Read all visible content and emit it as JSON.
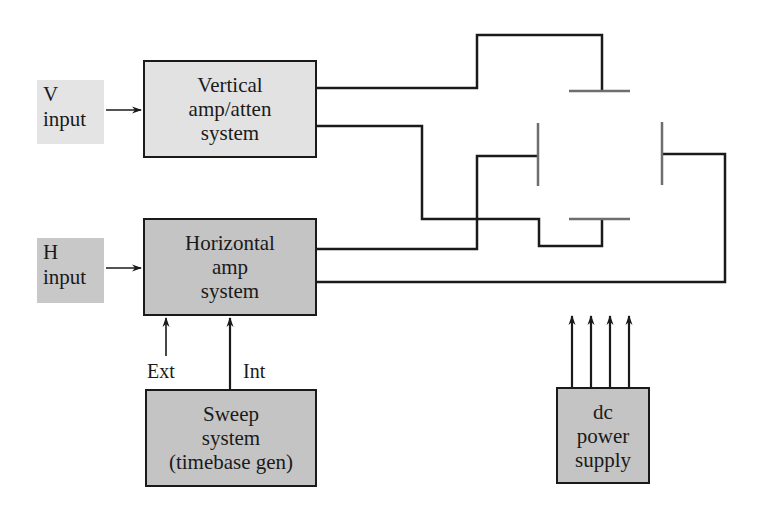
{
  "diagram": {
    "inputs": [
      {
        "id": "v-input",
        "lines": [
          "V",
          "input"
        ]
      },
      {
        "id": "h-input",
        "lines": [
          "H",
          "input"
        ]
      }
    ],
    "blocks": [
      {
        "id": "vertical",
        "lines": [
          "Vertical",
          "amp/atten",
          "system"
        ]
      },
      {
        "id": "horizontal",
        "lines": [
          "Horizontal",
          "amp",
          "system"
        ]
      },
      {
        "id": "sweep",
        "lines": [
          "Sweep",
          "system",
          "(timebase gen)"
        ]
      },
      {
        "id": "power",
        "lines": [
          "dc",
          "power",
          "supply"
        ]
      }
    ],
    "edge_labels": {
      "ext": "Ext",
      "int": "Int"
    },
    "deflection_plates": [
      "top-vertical-plate",
      "bottom-vertical-plate",
      "left-horizontal-plate",
      "right-horizontal-plate"
    ],
    "colors": {
      "stroke": "#1a1a1a",
      "plate": "#6e6e6e",
      "light_fill": "#e2e2e2",
      "dark_fill": "#c4c4c4"
    }
  }
}
